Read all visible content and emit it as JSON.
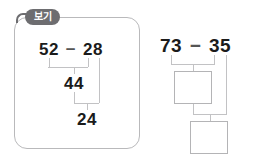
{
  "worksheet": {
    "example_label": "보기"
  },
  "example": {
    "minuend": "52",
    "operator": "−",
    "subtrahend": "28",
    "step1_result": "44",
    "step2_result": "24"
  },
  "problem": {
    "minuend": "73",
    "operator": "−",
    "subtrahend": "35",
    "step1_result": "",
    "step2_result": ""
  },
  "colors": {
    "panel_border": "#b9b9bb",
    "tab_background": "#6d6d70",
    "tab_text": "#ffffff",
    "digit_text": "#1b1b1b",
    "connector_line": "#c2c2c4",
    "answer_box_border": "#b4b4b6",
    "page_background": "#ffffff"
  }
}
